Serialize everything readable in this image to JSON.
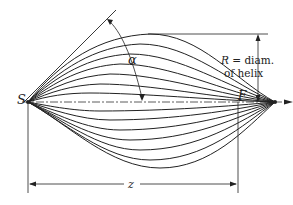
{
  "diagram": {
    "labels": {
      "start": "S",
      "finish": "F",
      "angle": "α",
      "radius_line1": "R = diam.",
      "radius_line2": "of helix",
      "length": "z"
    },
    "curve_count_upper": 7,
    "curve_count_lower": 7,
    "colors": {
      "line": "#222222",
      "background": "#ffffff"
    }
  }
}
